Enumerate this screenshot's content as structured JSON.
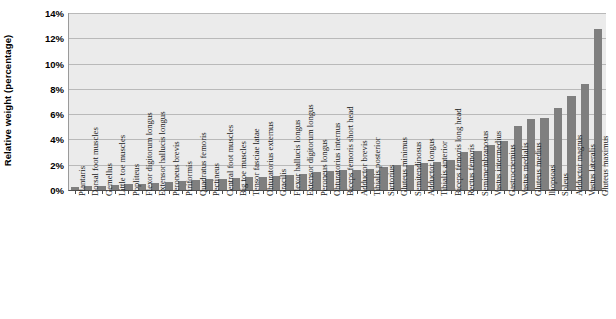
{
  "chart": {
    "type": "bar",
    "ylabel": "Relative weight (percentage)",
    "ytick_labels": [
      "0%",
      "2%",
      "4%",
      "6%",
      "8%",
      "10%",
      "12%",
      "14%"
    ],
    "ytick_values": [
      0,
      2,
      4,
      6,
      8,
      10,
      12,
      14
    ],
    "bar_color": "#7f7f7f",
    "plot_bg_color": "#ebebeb",
    "gridline_color": "#b9b9b9",
    "axis_color": "#4d4d4d"
  },
  "chart_data": {
    "type": "bar",
    "title": "",
    "subtitle": "",
    "xlabel": "",
    "ylabel": "Relative weight (percentage)",
    "ylim": [
      0,
      14
    ],
    "yticks": [
      0,
      2,
      4,
      6,
      8,
      10,
      12,
      14
    ],
    "ytick_labels": [
      "0%",
      "2%",
      "4%",
      "6%",
      "8%",
      "10%",
      "12%",
      "14%"
    ],
    "grid": true,
    "legend": false,
    "legend_position": "none",
    "orientation": "vertical",
    "sorted": "ascending",
    "units": "percent",
    "categories": [
      "Plantaris",
      "Dorsal foot muscles",
      "Gemellus",
      "Little toe muscles",
      "Popliteus",
      "Flexor digitorum longus",
      "Extensor hallucis longus",
      "Peroneus brevis",
      "Piriformis",
      "Quadratus femoris",
      "Pectineus",
      "Central foot muscles",
      "Big toe muscles",
      "Tensor fasciae latae",
      "Obturatorius externus",
      "Gracilis",
      "Flexor hallucis longus",
      "Extensor digitorum longus",
      "Peroneus longus",
      "Obturatorius internus",
      "Biceps femoris short head",
      "Adductor brevis",
      "Tibialis posterior",
      "Sartorius",
      "Gluteus minimus",
      "Semitendinosus",
      "Adductor longus",
      "Tibialis anterior",
      "Biceps femoris long head",
      "Rectus femoris",
      "Semimembranosus",
      "Vastus intermedius",
      "Gastrocnemius",
      "Vastus medialis",
      "Gluteus medius",
      "Iliopsoas",
      "Soleus",
      "Adductor magnus",
      "Vastus lateralis",
      "Gluteus maximus"
    ],
    "values": [
      0.25,
      0.3,
      0.35,
      0.4,
      0.45,
      0.5,
      0.55,
      0.6,
      0.7,
      0.8,
      0.85,
      0.9,
      0.95,
      1.0,
      1.05,
      1.1,
      1.2,
      1.3,
      1.4,
      1.5,
      1.55,
      1.6,
      1.7,
      1.8,
      1.95,
      2.0,
      2.1,
      2.2,
      2.4,
      3.0,
      3.1,
      3.6,
      3.9,
      5.1,
      5.6,
      5.7,
      6.5,
      7.4,
      8.4,
      12.7
    ]
  }
}
